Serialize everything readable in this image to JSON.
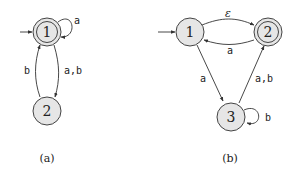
{
  "diagrams": [
    {
      "id": "a",
      "caption": "(a)",
      "states": [
        {
          "label": "1",
          "start": true,
          "accept": true
        },
        {
          "label": "2",
          "start": false,
          "accept": false
        }
      ],
      "transitions": [
        {
          "from": "1",
          "to": "1",
          "label": "a"
        },
        {
          "from": "1",
          "to": "2",
          "label": "a,b"
        },
        {
          "from": "2",
          "to": "1",
          "label": "b"
        }
      ]
    },
    {
      "id": "b",
      "caption": "(b)",
      "states": [
        {
          "label": "1",
          "start": true,
          "accept": false
        },
        {
          "label": "2",
          "start": false,
          "accept": true
        },
        {
          "label": "3",
          "start": false,
          "accept": false
        }
      ],
      "transitions": [
        {
          "from": "1",
          "to": "2",
          "label": "ε"
        },
        {
          "from": "2",
          "to": "1",
          "label": "a"
        },
        {
          "from": "1",
          "to": "3",
          "label": "a"
        },
        {
          "from": "3",
          "to": "2",
          "label": "a,b"
        },
        {
          "from": "3",
          "to": "3",
          "label": "b"
        }
      ]
    }
  ],
  "colors": {
    "state_fill": "#e6e6e6",
    "stroke": "#444444"
  }
}
